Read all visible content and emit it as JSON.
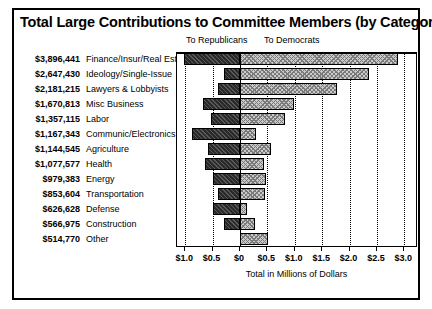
{
  "chart_title": "Total Large Contributions to Committee Members (by Category)",
  "legend": {
    "republicans": "To Republicans",
    "democrats": "To Democrats"
  },
  "axis": {
    "title": "Total in Millions of Dollars",
    "tick_labels": [
      "$1.0",
      "$0.5",
      "$0",
      "$0.5",
      "$1.0",
      "$1.5",
      "$2.0",
      "$2.5",
      "$3.0"
    ],
    "tick_values": [
      -1.0,
      -0.5,
      0,
      0.5,
      1.0,
      1.5,
      2.0,
      2.5,
      3.0
    ],
    "xlim": [
      -1.15,
      3.25
    ],
    "grid": true,
    "grid_style": "dotted-vertical"
  },
  "colors": {
    "republican_bar": "#2a2a2a",
    "democrat_bar": "#c9c9c9",
    "frame": "#000000",
    "background": "#ffffff"
  },
  "chart_data": {
    "type": "bar",
    "orientation": "horizontal-diverging",
    "title": "Total Large Contributions to Committee Members (by Category)",
    "xlabel": "Total in Millions of Dollars",
    "ylabel": "",
    "xlim": [
      -1.15,
      3.25
    ],
    "grid": true,
    "legend_position": "top",
    "categories": [
      "Finance/Insur/Real Est",
      "Ideology/Single-Issue",
      "Lawyers & Lobbyists",
      "Misc Business",
      "Labor",
      "Communic/Electronics",
      "Agriculture",
      "Health",
      "Energy",
      "Transportation",
      "Defense",
      "Construction",
      "Other"
    ],
    "totals_formatted": [
      "$3,896,441",
      "$2,647,430",
      "$2,181,215",
      "$1,670,813",
      "$1,357,115",
      "$1,167,343",
      "$1,144,545",
      "$1,077,577",
      "$979,383",
      "$853,604",
      "$626,628",
      "$566,975",
      "$514,770"
    ],
    "totals": [
      3896441,
      2647430,
      2181215,
      1670813,
      1357115,
      1167343,
      1144545,
      1077577,
      979383,
      853604,
      626628,
      566975,
      514770
    ],
    "series": [
      {
        "name": "To Republicans",
        "note": "plotted left of zero, in millions of dollars",
        "values": [
          -1.02,
          -0.29,
          -0.41,
          -0.68,
          -0.53,
          -0.88,
          -0.59,
          -0.64,
          -0.5,
          -0.4,
          -0.5,
          -0.29,
          0.0
        ]
      },
      {
        "name": "To Democrats",
        "note": "plotted right of zero, in millions of dollars",
        "values": [
          2.88,
          2.36,
          1.77,
          0.99,
          0.83,
          0.29,
          0.56,
          0.44,
          0.48,
          0.45,
          0.13,
          0.28,
          0.52
        ]
      }
    ]
  },
  "rows": [
    {
      "amount": "$3,896,441",
      "category": "Finance/Insur/Real Est",
      "rep": -1.02,
      "dem": 2.88
    },
    {
      "amount": "$2,647,430",
      "category": "Ideology/Single-Issue",
      "rep": -0.29,
      "dem": 2.36
    },
    {
      "amount": "$2,181,215",
      "category": "Lawyers & Lobbyists",
      "rep": -0.41,
      "dem": 1.77
    },
    {
      "amount": "$1,670,813",
      "category": "Misc Business",
      "rep": -0.68,
      "dem": 0.99
    },
    {
      "amount": "$1,357,115",
      "category": "Labor",
      "rep": -0.53,
      "dem": 0.83
    },
    {
      "amount": "$1,167,343",
      "category": "Communic/Electronics",
      "rep": -0.88,
      "dem": 0.29
    },
    {
      "amount": "$1,144,545",
      "category": "Agriculture",
      "rep": -0.59,
      "dem": 0.56
    },
    {
      "amount": "$1,077,577",
      "category": "Health",
      "rep": -0.64,
      "dem": 0.44
    },
    {
      "amount": "$979,383",
      "category": "Energy",
      "rep": -0.5,
      "dem": 0.48
    },
    {
      "amount": "$853,604",
      "category": "Transportation",
      "rep": -0.4,
      "dem": 0.45
    },
    {
      "amount": "$626,628",
      "category": "Defense",
      "rep": -0.5,
      "dem": 0.13
    },
    {
      "amount": "$566,975",
      "category": "Construction",
      "rep": -0.29,
      "dem": 0.28
    },
    {
      "amount": "$514,770",
      "category": "Other",
      "rep": 0.0,
      "dem": 0.52
    }
  ]
}
